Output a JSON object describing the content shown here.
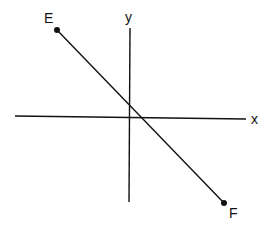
{
  "diagram": {
    "axes": {
      "x_label": "x",
      "y_label": "y"
    },
    "segment": {
      "start_label": "E",
      "end_label": "F",
      "endpoint_marker": "filled-dot"
    },
    "colors": {
      "ink": "#111111",
      "background": "#ffffff"
    }
  }
}
